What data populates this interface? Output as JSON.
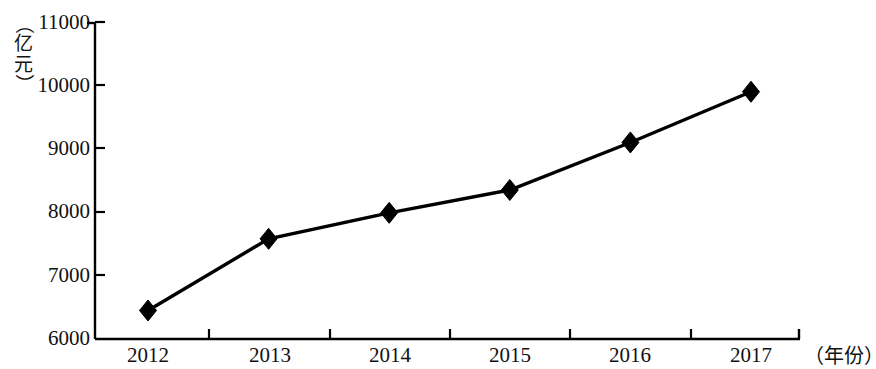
{
  "chart_data": {
    "type": "line",
    "title": "",
    "subtitle": "",
    "xlabel": "（年份）",
    "ylabel": "（亿元）",
    "categories": [
      "2012",
      "2013",
      "2014",
      "2015",
      "2016",
      "2017"
    ],
    "values": [
      6450,
      7580,
      7990,
      8350,
      9100,
      9900
    ],
    "series": [
      {
        "name": "",
        "values": [
          6450,
          7580,
          7990,
          8350,
          9100,
          9900
        ]
      }
    ],
    "ylim": [
      6000,
      11000
    ],
    "ytick_values": [
      6000,
      7000,
      8000,
      9000,
      10000,
      11000
    ],
    "ytick_labels": [
      "6000",
      "7000",
      "8000",
      "9000",
      "10000",
      "11000"
    ],
    "xtick_labels": [
      "2012",
      "2013",
      "2014",
      "2015",
      "2016",
      "2017"
    ],
    "grid": false,
    "legend": false,
    "legend_position": "none",
    "marker": "diamond",
    "line_color": "#000000",
    "marker_color": "#000000",
    "background_color": "#ffffff",
    "axis_color": "#000000",
    "annotations": []
  },
  "axis": {
    "y_unit_open_paren": "（",
    "y_unit_char_1": "亿",
    "y_unit_char_2": "元",
    "y_unit_close_paren": "）",
    "x_title": "（年份）"
  }
}
